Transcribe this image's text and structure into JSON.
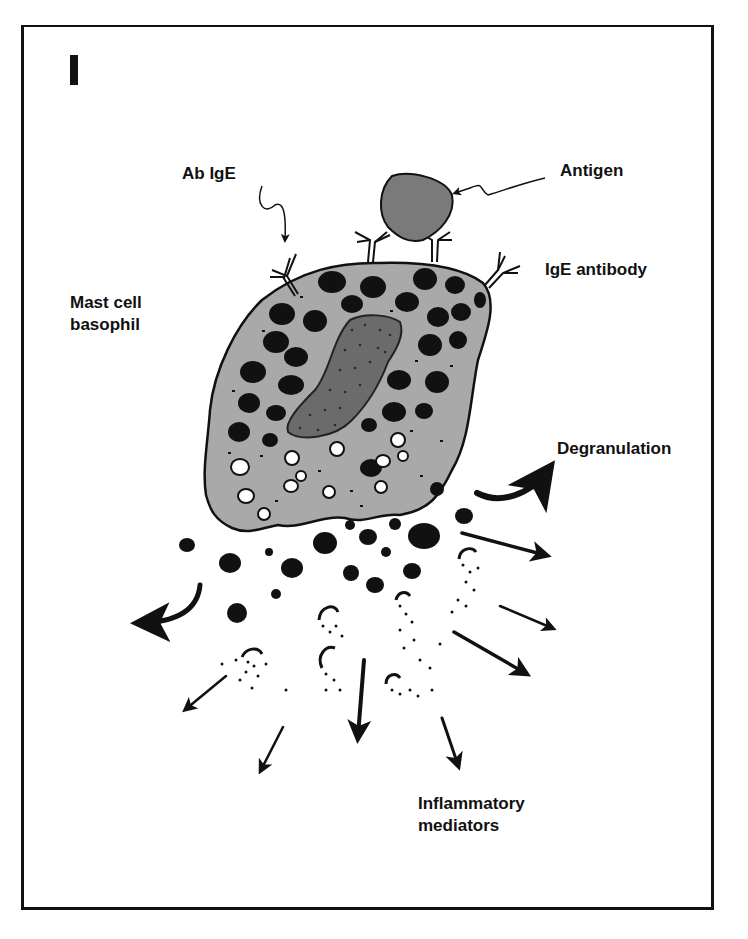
{
  "figure": {
    "panel_letter": "I",
    "labels": {
      "ab_ige": "Ab IgE",
      "antigen": "Antigen",
      "ige_antibody": "IgE antibody",
      "mast_cell": "Mast cell\nbasophil",
      "degranulation": "Degranulation",
      "inflammatory_mediators": "Inflammatory\nmediators"
    },
    "colors": {
      "ink": "#111111",
      "cell": "#a9a9a9",
      "nucleus": "#6b6b6b",
      "antigen": "#7a7a7a",
      "background": "#ffffff"
    }
  }
}
